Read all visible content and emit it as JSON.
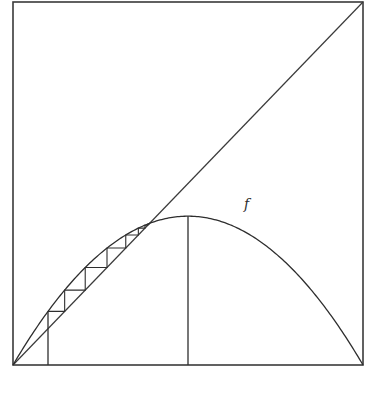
{
  "figure": {
    "curve_label": "f"
  },
  "chart_data": {
    "type": "line",
    "title": "",
    "xlabel": "",
    "ylabel": "",
    "xlim": [
      0,
      1
    ],
    "ylim": [
      0,
      1
    ],
    "grid": false,
    "series": [
      {
        "name": "f",
        "kind": "parabola",
        "formula": "f(x) = r x (1 - x)",
        "r": 1.64
      },
      {
        "name": "diagonal",
        "kind": "line",
        "formula": "y = x"
      },
      {
        "name": "cobweb",
        "kind": "staircase",
        "x0": 0.1,
        "iterations": 14
      }
    ],
    "vertical_lines": [
      {
        "name": "initial-point",
        "x": 0.1,
        "from": 0,
        "to": "f(x0)"
      },
      {
        "name": "maximum",
        "x": 0.5,
        "from": 0,
        "to": "f(0.5)"
      }
    ],
    "fixed_point": 0.39,
    "peak": {
      "x": 0.5,
      "y": 0.41
    },
    "annotations": [
      {
        "text": "f",
        "x": 0.66,
        "y": 0.43
      }
    ]
  },
  "layout": {
    "box": {
      "left": 13,
      "top": 2,
      "right": 363,
      "bottom": 365
    },
    "stroke_color": "#2e2e2e"
  }
}
